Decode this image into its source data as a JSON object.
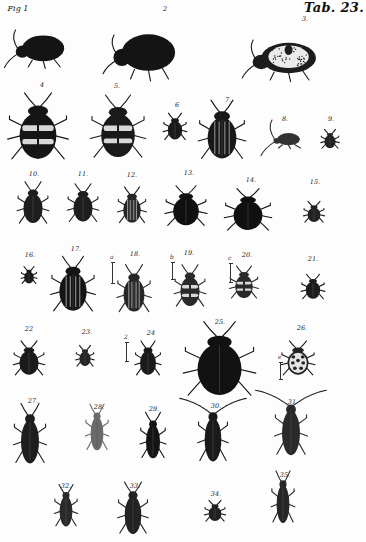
{
  "plate": {
    "title": "Tab. 23.",
    "background": "#fdfdfd",
    "ink": "#111111"
  },
  "figures": [
    {
      "num": "Fig 1",
      "x": 40,
      "y": 50,
      "w": 55,
      "h": 34,
      "view": "side",
      "fill": "#141414"
    },
    {
      "num": "2",
      "x": 145,
      "y": 55,
      "w": 70,
      "h": 48,
      "view": "side",
      "fill": "#141414"
    },
    {
      "num": "3.",
      "x": 285,
      "y": 60,
      "w": 72,
      "h": 40,
      "view": "side-spotted",
      "fill": "#1c1c1c"
    },
    {
      "num": "4",
      "x": 38,
      "y": 130,
      "w": 46,
      "h": 70,
      "view": "top-banded",
      "fill": "#151515"
    },
    {
      "num": "5.",
      "x": 118,
      "y": 130,
      "w": 42,
      "h": 66,
      "view": "top-banded",
      "fill": "#1a1a1a"
    },
    {
      "num": "6",
      "x": 175,
      "y": 128,
      "w": 18,
      "h": 28,
      "view": "top",
      "fill": "#1a1a1a"
    },
    {
      "num": "7.",
      "x": 222,
      "y": 133,
      "w": 36,
      "h": 62,
      "view": "top-striped",
      "fill": "#181818"
    },
    {
      "num": "8.",
      "x": 287,
      "y": 140,
      "w": 30,
      "h": 16,
      "view": "side-small",
      "fill": "#333333"
    },
    {
      "num": "9.",
      "x": 330,
      "y": 140,
      "w": 14,
      "h": 20,
      "view": "top",
      "fill": "#222222"
    },
    {
      "num": "10.",
      "x": 33,
      "y": 205,
      "w": 24,
      "h": 44,
      "view": "top",
      "fill": "#1e1e1e"
    },
    {
      "num": "11.",
      "x": 83,
      "y": 205,
      "w": 24,
      "h": 40,
      "view": "top",
      "fill": "#1e1e1e"
    },
    {
      "num": "12.",
      "x": 132,
      "y": 207,
      "w": 22,
      "h": 38,
      "view": "top-striped",
      "fill": "#252525"
    },
    {
      "num": "13.",
      "x": 186,
      "y": 208,
      "w": 32,
      "h": 42,
      "view": "top",
      "fill": "#101010"
    },
    {
      "num": "14.",
      "x": 248,
      "y": 212,
      "w": 36,
      "h": 44,
      "view": "top",
      "fill": "#101010"
    },
    {
      "num": "15.",
      "x": 314,
      "y": 213,
      "w": 16,
      "h": 22,
      "view": "top",
      "fill": "#222222"
    },
    {
      "num": "16.",
      "x": 29,
      "y": 276,
      "w": 12,
      "h": 18,
      "view": "top",
      "fill": "#1a1a1a"
    },
    {
      "num": "17.",
      "x": 73,
      "y": 287,
      "w": 34,
      "h": 58,
      "view": "top-striped",
      "fill": "#151515"
    },
    {
      "num": "18.",
      "x": 134,
      "y": 291,
      "w": 26,
      "h": 50,
      "view": "top-striped",
      "fill": "#262626",
      "scale": {
        "letter": "a",
        "x": 112,
        "y": 262,
        "h": 22
      }
    },
    {
      "num": "19.",
      "x": 190,
      "y": 288,
      "w": 24,
      "h": 44,
      "view": "top-banded",
      "fill": "#2a2a2a",
      "scale": {
        "letter": "b",
        "x": 172,
        "y": 262,
        "h": 18
      }
    },
    {
      "num": "20.",
      "x": 244,
      "y": 284,
      "w": 22,
      "h": 34,
      "view": "top-banded",
      "fill": "#2a2a2a",
      "scale": {
        "letter": "c",
        "x": 230,
        "y": 263,
        "h": 20
      }
    },
    {
      "num": "21.",
      "x": 313,
      "y": 288,
      "w": 18,
      "h": 26,
      "view": "top",
      "fill": "#1c1c1c"
    },
    {
      "num": "22",
      "x": 29,
      "y": 360,
      "w": 24,
      "h": 36,
      "view": "top",
      "fill": "#1a1a1a"
    },
    {
      "num": "23.",
      "x": 85,
      "y": 357,
      "w": 14,
      "h": 22,
      "view": "top",
      "fill": "#252525"
    },
    {
      "num": "24",
      "x": 148,
      "y": 360,
      "w": 20,
      "h": 36,
      "view": "top",
      "fill": "#1a1a1a",
      "scale": {
        "letter": "2",
        "x": 126,
        "y": 342,
        "h": 20
      }
    },
    {
      "num": "25.",
      "x": 219,
      "y": 363,
      "w": 55,
      "h": 78,
      "view": "top",
      "fill": "#121212"
    },
    {
      "num": "26.",
      "x": 298,
      "y": 360,
      "w": 26,
      "h": 36,
      "view": "top-spotted",
      "fill": "#222222",
      "scale": {
        "letter": "e",
        "x": 280,
        "y": 362,
        "h": 18
      }
    },
    {
      "num": "27.",
      "x": 30,
      "y": 437,
      "w": 28,
      "h": 60,
      "view": "top-long",
      "fill": "#1e1e1e"
    },
    {
      "num": "28.",
      "x": 97,
      "y": 430,
      "w": 20,
      "h": 46,
      "view": "top-long",
      "fill": "#6a6a6a"
    },
    {
      "num": "29.",
      "x": 153,
      "y": 438,
      "w": 22,
      "h": 46,
      "view": "top-long",
      "fill": "#141414"
    },
    {
      "num": "30.",
      "x": 213,
      "y": 435,
      "w": 26,
      "h": 60,
      "view": "top-long-antenna",
      "fill": "#1a1a1a"
    },
    {
      "num": "31.",
      "x": 291,
      "y": 428,
      "w": 28,
      "h": 62,
      "view": "top-long-antenna",
      "fill": "#2a2a2a"
    },
    {
      "num": "32.",
      "x": 66,
      "y": 508,
      "w": 20,
      "h": 42,
      "view": "top-long",
      "fill": "#2a2a2a"
    },
    {
      "num": "33.",
      "x": 133,
      "y": 511,
      "w": 26,
      "h": 52,
      "view": "top-long",
      "fill": "#232323"
    },
    {
      "num": "34.",
      "x": 215,
      "y": 512,
      "w": 16,
      "h": 22,
      "view": "top-small",
      "fill": "#202020"
    },
    {
      "num": "35.",
      "x": 283,
      "y": 500,
      "w": 20,
      "h": 52,
      "view": "top-long",
      "fill": "#262626"
    }
  ],
  "labels_pos": [
    {
      "x": 12,
      "y": 4
    },
    {
      "x": 165,
      "y": 5
    },
    {
      "x": 305,
      "y": 15
    },
    {
      "x": 42,
      "y": 81
    },
    {
      "x": 117,
      "y": 82
    },
    {
      "x": 177,
      "y": 101
    },
    {
      "x": 228,
      "y": 96
    },
    {
      "x": 285,
      "y": 115
    },
    {
      "x": 331,
      "y": 115
    },
    {
      "x": 34,
      "y": 170
    },
    {
      "x": 83,
      "y": 170
    },
    {
      "x": 132,
      "y": 171
    },
    {
      "x": 189,
      "y": 169
    },
    {
      "x": 251,
      "y": 176
    },
    {
      "x": 315,
      "y": 178
    },
    {
      "x": 30,
      "y": 251
    },
    {
      "x": 76,
      "y": 245
    },
    {
      "x": 135,
      "y": 250
    },
    {
      "x": 189,
      "y": 249
    },
    {
      "x": 247,
      "y": 251
    },
    {
      "x": 313,
      "y": 255
    },
    {
      "x": 29,
      "y": 325
    },
    {
      "x": 87,
      "y": 328
    },
    {
      "x": 151,
      "y": 329
    },
    {
      "x": 220,
      "y": 318
    },
    {
      "x": 302,
      "y": 324
    },
    {
      "x": 33,
      "y": 397
    },
    {
      "x": 99,
      "y": 403
    },
    {
      "x": 154,
      "y": 405
    },
    {
      "x": 216,
      "y": 402
    },
    {
      "x": 293,
      "y": 398
    },
    {
      "x": 66,
      "y": 482
    },
    {
      "x": 135,
      "y": 482
    },
    {
      "x": 216,
      "y": 490
    },
    {
      "x": 285,
      "y": 471
    }
  ]
}
